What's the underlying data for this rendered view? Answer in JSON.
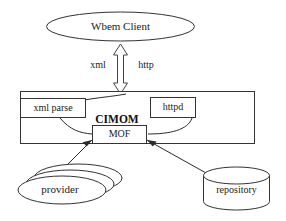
{
  "diagram": {
    "type": "architecture-block-diagram",
    "nodes": {
      "client": {
        "label": "Wbem Client",
        "shape": "ellipse"
      },
      "container": {
        "label": "CIMOM",
        "shape": "rectangle"
      },
      "xml_parse": {
        "label": "xml parse",
        "shape": "rectangle"
      },
      "httpd": {
        "label": "httpd",
        "shape": "rectangle"
      },
      "mof": {
        "label": "MOF",
        "shape": "rectangle"
      },
      "provider": {
        "label": "provider",
        "shape": "stacked-ellipse",
        "stack_count": 3
      },
      "repository": {
        "label": "repository",
        "shape": "cylinder"
      }
    },
    "edges": [
      {
        "from": "client",
        "to": "container",
        "labels": [
          "xml",
          "http"
        ],
        "style": "hollow-double-arrow"
      },
      {
        "from": "xml_parse",
        "to": "mof",
        "style": "curve"
      },
      {
        "from": "httpd",
        "to": "mof",
        "style": "curve"
      },
      {
        "from": "mof",
        "to": "provider",
        "style": "solid-double-arrow"
      },
      {
        "from": "mof",
        "to": "repository",
        "style": "solid-double-arrow"
      }
    ],
    "edge_labels": {
      "xml": "xml",
      "http": "http"
    },
    "colors": {
      "background": "#ffffff",
      "stroke": "#333333",
      "text": "#1a1a1a"
    }
  }
}
